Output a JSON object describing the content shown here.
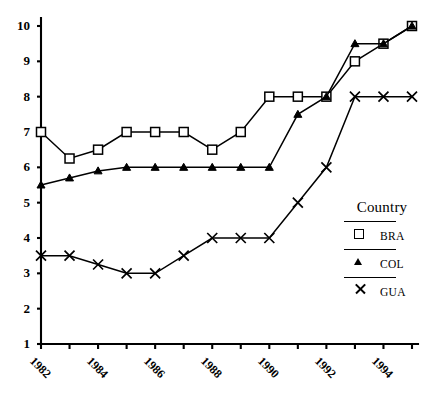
{
  "top_fragment": "",
  "chart_data": {
    "type": "line",
    "title": "",
    "xlabel": "",
    "ylabel": "",
    "xlim": [
      1981.5,
      1995.5
    ],
    "ylim": [
      1,
      10
    ],
    "grid": false,
    "legend_position": "right",
    "legend_title": "Country",
    "y_ticks": [
      1,
      2,
      3,
      4,
      5,
      6,
      7,
      8,
      9,
      10
    ],
    "y_tick_labels": [
      "1",
      "2",
      "3",
      "4",
      "5",
      "6",
      "7",
      "8",
      "9",
      "10"
    ],
    "x_ticks": [
      1982,
      1983,
      1984,
      1985,
      1986,
      1987,
      1988,
      1989,
      1990,
      1991,
      1992,
      1993,
      1994,
      1995
    ],
    "x_tick_labels": [
      "1982",
      "",
      "1984",
      "",
      "1986",
      "",
      "1988",
      "",
      "1990",
      "",
      "1992",
      "",
      "1994",
      ""
    ],
    "x": [
      1982,
      1983,
      1984,
      1985,
      1986,
      1987,
      1988,
      1989,
      1990,
      1991,
      1992,
      1993,
      1994,
      1995
    ],
    "series": [
      {
        "name": "BRA",
        "marker": "square",
        "values": [
          7,
          6.25,
          6.5,
          7,
          7,
          7,
          6.5,
          7,
          8,
          8,
          8,
          9,
          9.5,
          10
        ]
      },
      {
        "name": "COL",
        "marker": "triangle",
        "values": [
          5.5,
          5.7,
          5.9,
          6,
          6,
          6,
          6,
          6,
          6,
          7.5,
          8,
          9.5,
          9.5,
          10
        ]
      },
      {
        "name": "GUA",
        "marker": "x",
        "values": [
          3.5,
          3.5,
          3.25,
          3,
          3,
          3.5,
          4,
          4,
          4,
          5,
          6,
          8,
          8,
          8
        ]
      }
    ]
  },
  "legend": {
    "title": "Country",
    "items": [
      {
        "label": "BRA",
        "symbol": "square-marker"
      },
      {
        "label": "COL",
        "symbol": "triangle-marker"
      },
      {
        "label": "GUA",
        "symbol": "x-marker"
      }
    ]
  }
}
